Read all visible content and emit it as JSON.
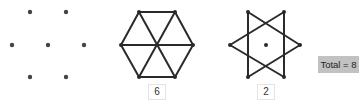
{
  "figures": [
    {
      "name": "dot-grid",
      "dots": [
        [
          30,
          12
        ],
        [
          66,
          12
        ],
        [
          12,
          45
        ],
        [
          48,
          45
        ],
        [
          84,
          45
        ],
        [
          30,
          77
        ],
        [
          66,
          77
        ]
      ]
    },
    {
      "name": "hexagon-with-diagonals",
      "vertices": [
        [
          139,
          12
        ],
        [
          175,
          12
        ],
        [
          193,
          45
        ],
        [
          175,
          77
        ],
        [
          139,
          77
        ],
        [
          121,
          45
        ]
      ],
      "center": [
        157,
        45
      ],
      "count_label": "6"
    },
    {
      "name": "hexagram-star",
      "triangles": [
        [
          [
            248,
            12
          ],
          [
            300,
            45
          ],
          [
            248,
            77
          ]
        ],
        [
          [
            284,
            12
          ],
          [
            230,
            45
          ],
          [
            284,
            77
          ]
        ]
      ],
      "center": [
        266,
        45
      ],
      "count_label": "2"
    }
  ],
  "total": {
    "label": "Total = 8"
  },
  "colors": {
    "line": "#2a2a2a",
    "dot": "#444444",
    "total_bg": "#c2c2c2"
  }
}
